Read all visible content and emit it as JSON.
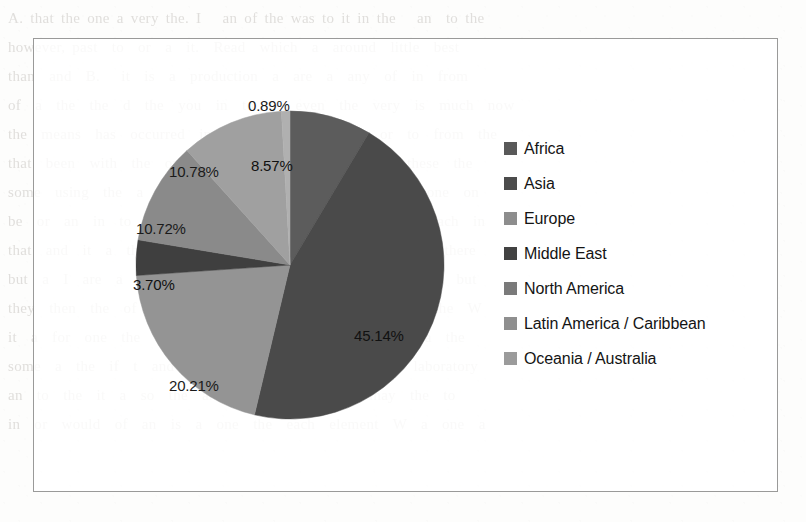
{
  "page": {
    "background_color": "#fdfdfc",
    "ghost_text": "A. that the one a very the. I   an of the was to it in the   an  to the\nhowever, past  to  or  a  it.  Read  which  a  around  little  best\nthan  and  B.   it  is  a  production  a  are  a  any  of  in  from\nof  a  the  the  d  the  you  in  to  or  even  the  very  is  much  now\nthe  means  has  occurred  in  of  the  is  it  more  or  to  from  the\nthat  been  with  the  only  a  considered  and  or  the  these  the\nsome  using  the  a  it  a  the  as  or  and  these  the  a  one  on\nbe  or  an  in  to  and  of  the  many  a  not  it  of  the  each  in\nthat  and  it  a  the  one  of  the  little  is  that  of  the  a  there\nbut  a  I  are  a  for  a  and  the  or  part  and  work  to  a  but\nthey  then  the  of  the  number  is  of  a  as  to  without  the  W\nit  a  for  one  the  a  of  if  and  that  or  in  the  one  a  the\nsome  a  the  if  t  and  K  means  and  the  preceding  laboratory\nan  to  the  it  a  so  the  and  other  in  and  a  may  the  to\nin  or  would  of  an  is  a  one  the  each  element  W  a  one  a"
  },
  "chart_data": {
    "type": "pie",
    "title": "",
    "legend_position": "right",
    "categories": [
      "Africa",
      "Asia",
      "Europe",
      "Middle East",
      "North America",
      "Latin America / Caribbean",
      "Oceania / Australia"
    ],
    "values": [
      8.57,
      45.14,
      20.21,
      3.7,
      10.72,
      10.78,
      0.89
    ],
    "value_labels": [
      "8.57%",
      "45.14%",
      "20.21%",
      "3.70%",
      "10.72%",
      "10.78%",
      "0.89%"
    ],
    "colors": [
      "#5c5c5c",
      "#4a4a4a",
      "#949494",
      "#3f3f3f",
      "#8a8a8a",
      "#a0a0a0",
      "#b0b0b0"
    ],
    "start_angle_deg": 0,
    "direction": "clockwise",
    "units": "percent",
    "slices": [
      {
        "name": "Africa",
        "value": 8.57,
        "label": "8.57%",
        "color": "#5c5c5c",
        "label_x": 116,
        "label_y": 70,
        "on_dark": true
      },
      {
        "name": "Asia",
        "value": 45.14,
        "label": "45.14%",
        "color": "#4a4a4a",
        "label_x": 219,
        "label_y": 240,
        "on_dark": true
      },
      {
        "name": "Europe",
        "value": 20.21,
        "label": "20.21%",
        "color": "#949494",
        "label_x": 34,
        "label_y": 290,
        "on_dark": false
      },
      {
        "name": "Middle East",
        "value": 3.7,
        "label": "3.70%",
        "color": "#3f3f3f",
        "label_x": -2,
        "label_y": 189,
        "on_dark": true
      },
      {
        "name": "North America",
        "value": 10.72,
        "label": "10.72%",
        "color": "#8a8a8a",
        "label_x": 1,
        "label_y": 133,
        "on_dark": false
      },
      {
        "name": "Latin America / Caribbean",
        "value": 10.78,
        "label": "10.78%",
        "color": "#a0a0a0",
        "label_x": 34,
        "label_y": 76,
        "on_dark": false
      },
      {
        "name": "Oceania / Australia",
        "value": 0.89,
        "label": "0.89%",
        "color": "#b0b0b0",
        "label_x": 113,
        "label_y": 10,
        "on_dark": false
      }
    ]
  },
  "legend": {
    "items": [
      {
        "label": "Africa",
        "color": "#595959"
      },
      {
        "label": "Asia",
        "color": "#4c4c4c"
      },
      {
        "label": "Europe",
        "color": "#8d8d8d"
      },
      {
        "label": "Middle East",
        "color": "#424242"
      },
      {
        "label": "North America",
        "color": "#7a7a7a"
      },
      {
        "label": "Latin America / Caribbean",
        "color": "#8f8f8f"
      },
      {
        "label": "Oceania / Australia",
        "color": "#9b9b9b"
      }
    ]
  }
}
